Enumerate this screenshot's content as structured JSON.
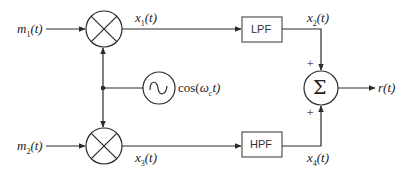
{
  "diagram": {
    "type": "block-diagram",
    "inputs": [
      {
        "id": "m1",
        "label": "m1(t)",
        "display": {
          "base": "m",
          "sub": "1",
          "arg": "(t)"
        }
      },
      {
        "id": "m2",
        "label": "m2(t)",
        "display": {
          "base": "m",
          "sub": "2",
          "arg": "(t)"
        }
      }
    ],
    "oscillator": {
      "label": "cos(ωct)",
      "display": {
        "pre": "cos(",
        "omega": "ω",
        "sub": "c",
        "post": "t)"
      }
    },
    "signals": [
      {
        "id": "x1",
        "display": {
          "base": "x",
          "sub": "1",
          "arg": "(t)"
        }
      },
      {
        "id": "x2",
        "display": {
          "base": "x",
          "sub": "2",
          "arg": "(t)"
        }
      },
      {
        "id": "x3",
        "display": {
          "base": "x",
          "sub": "3",
          "arg": "(t)"
        }
      },
      {
        "id": "x4",
        "display": {
          "base": "x",
          "sub": "4",
          "arg": "(t)"
        }
      }
    ],
    "blocks": {
      "lpf": "LPF",
      "hpf": "HPF",
      "sum": "Σ"
    },
    "sum_signs": {
      "top": "+",
      "bottom": "+"
    },
    "output": {
      "id": "r",
      "display": {
        "base": "r",
        "arg": "(t)"
      }
    },
    "colors": {
      "stroke": "#2a2a2a",
      "text": "#222222",
      "background": "#ffffff"
    }
  }
}
